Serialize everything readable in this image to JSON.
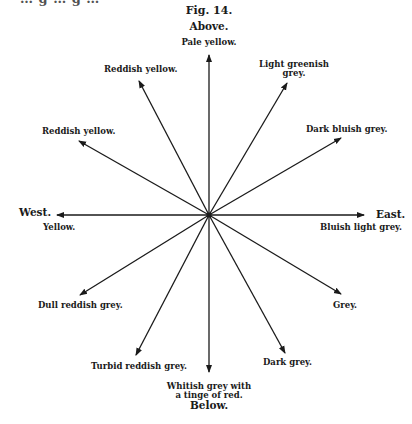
{
  "figure": {
    "title": "Fig. 14.",
    "clipped_top_text": "… g … g …",
    "directions": {
      "above": "Above.",
      "below": "Below.",
      "east": "East.",
      "west": "West."
    },
    "labels": {
      "up": "Pale yellow.",
      "nne_line1": "Light greenish",
      "nne_line2": "grey.",
      "ene": "Dark bluish grey.",
      "east": "Bluish light grey.",
      "ese": "Grey.",
      "sse": "Dark grey.",
      "down_line1": "Whitish grey with",
      "down_line2": "a tinge of red.",
      "ssw": "Turbid reddish grey.",
      "wsw": "Dull reddish grey.",
      "west": "Yellow.",
      "wnw": "Reddish yellow.",
      "nnw": "Reddish yellow."
    },
    "center": [
      209,
      215
    ],
    "arrows": [
      {
        "name": "up",
        "to": [
          209,
          55
        ]
      },
      {
        "name": "nne",
        "to": [
          287,
          83
        ]
      },
      {
        "name": "ene",
        "to": [
          341,
          138
        ]
      },
      {
        "name": "east",
        "to": [
          364,
          215
        ]
      },
      {
        "name": "ese",
        "to": [
          341,
          294
        ]
      },
      {
        "name": "sse",
        "to": [
          285,
          353
        ]
      },
      {
        "name": "down",
        "to": [
          209,
          372
        ]
      },
      {
        "name": "ssw",
        "to": [
          136,
          355
        ]
      },
      {
        "name": "wsw",
        "to": [
          80,
          295
        ]
      },
      {
        "name": "west",
        "to": [
          57,
          215
        ]
      },
      {
        "name": "wnw",
        "to": [
          79,
          141
        ]
      },
      {
        "name": "nnw",
        "to": [
          139,
          81
        ]
      }
    ],
    "colors": {
      "ink": "#1a1a1a",
      "background": "#ffffff"
    }
  }
}
